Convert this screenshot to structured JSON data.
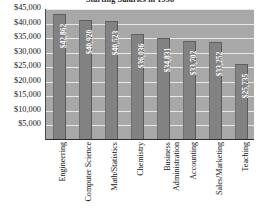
{
  "chart_data": {
    "type": "bar",
    "title": "Starting Salaries in 1998",
    "xlabel": "",
    "ylabel": "",
    "ylim": [
      0,
      45000
    ],
    "grid": true,
    "legend": "none",
    "ytick_labels": [
      "$45,000",
      "$40,000",
      "$35,000",
      "$30,000",
      "$25,000",
      "$20,000",
      "$15,000",
      "$10,000",
      "$5,000"
    ],
    "ytick_values": [
      45000,
      40000,
      35000,
      30000,
      25000,
      20000,
      15000,
      10000,
      5000
    ],
    "categories": [
      "Engineering",
      "Computer Science",
      "Math/Statistics",
      "Chemistry",
      "Business Administration",
      "Accounting",
      "Sales/Marketing",
      "Teaching"
    ],
    "values": [
      42862,
      40920,
      40523,
      36036,
      34831,
      33702,
      33252,
      25735
    ],
    "value_labels": [
      "$42,862",
      "$40,920",
      "$40,523",
      "$36,036",
      "$34,831",
      "$33,702",
      "$33,252",
      "$25,735"
    ],
    "category_lines": [
      [
        "Engineering"
      ],
      [
        "Computer Science"
      ],
      [
        "Math/Statistics"
      ],
      [
        "Chemistry"
      ],
      [
        "Business",
        "Administration"
      ],
      [
        "Accounting"
      ],
      [
        "Sales/Marketing"
      ],
      [
        "Teaching"
      ]
    ],
    "colors": {
      "bar_fill": "#828282",
      "plot_background": "#a8a8a8",
      "gridline": "#e8e8e8",
      "axis_line": "#2c2c2c",
      "value_label": "#ffffff",
      "tick_label": "#161616",
      "title": "#1d1d1d",
      "page_background": "#ffffff"
    }
  }
}
